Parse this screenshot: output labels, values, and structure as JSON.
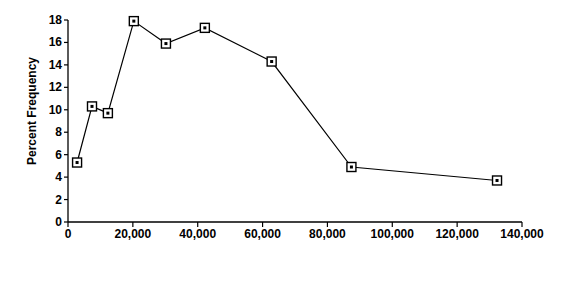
{
  "chart_data": {
    "type": "line",
    "title": "",
    "xlabel": "Family Income Level",
    "ylabel": "Percent Frequency",
    "xlim": [
      0,
      140000
    ],
    "ylim": [
      0,
      18
    ],
    "grid": false,
    "legend": "none",
    "marker": "open-square",
    "line_color": "#000000",
    "marker_fill": "#ffffff",
    "marker_edge": "#000000",
    "xticks": [
      0,
      20000,
      40000,
      60000,
      80000,
      100000,
      120000,
      140000
    ],
    "xtick_labels": [
      "0",
      "20,000",
      "40,000",
      "60,000",
      "80,000",
      "100,000",
      "120,000",
      "140,000"
    ],
    "yticks": [
      0,
      2,
      4,
      6,
      8,
      10,
      12,
      14,
      16,
      18
    ],
    "ytick_labels": [
      "0",
      "2",
      "4",
      "6",
      "8",
      "10",
      "12",
      "14",
      "16",
      "18"
    ],
    "x": [
      2800,
      7400,
      12300,
      20300,
      30200,
      42200,
      62800,
      87400,
      132300
    ],
    "values": [
      5.3,
      10.3,
      9.7,
      17.9,
      15.9,
      17.3,
      14.3,
      4.9,
      3.7
    ],
    "points": [
      {
        "x": 2800,
        "y": 5.3
      },
      {
        "x": 7400,
        "y": 10.3
      },
      {
        "x": 12300,
        "y": 9.7
      },
      {
        "x": 20300,
        "y": 17.9
      },
      {
        "x": 30200,
        "y": 15.9
      },
      {
        "x": 42200,
        "y": 17.3
      },
      {
        "x": 62800,
        "y": 14.3
      },
      {
        "x": 87400,
        "y": 4.9
      },
      {
        "x": 132300,
        "y": 3.7
      }
    ]
  }
}
